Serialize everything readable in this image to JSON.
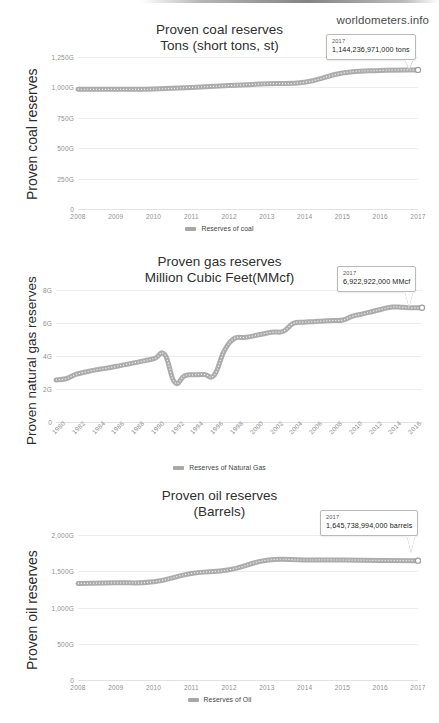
{
  "watermark": "worldometers.info",
  "charts": [
    {
      "id": "coal",
      "title_line1": "Proven coal reserves",
      "title_line2": "Tons (short tons, st)",
      "y_axis_title": "Proven coal reserves",
      "legend_label": "Reserves of coal",
      "tooltip": {
        "year": "2017",
        "value": "1,144,236,971,000 tons"
      }
    },
    {
      "id": "gas",
      "title_line1": "Proven gas reserves",
      "title_line2": "Million Cubic Feet(MMcf)",
      "y_axis_title": "Proven natural gas reserves",
      "legend_label": "Reserves of Natural Gas",
      "tooltip": {
        "year": "2017",
        "value": "6,922,922,000 MMcf"
      }
    },
    {
      "id": "oil",
      "title_line1": "Proven oil reserves",
      "title_line2": "(Barrels)",
      "y_axis_title": "Proven oil reserves",
      "legend_label": "Reserves of Oil",
      "tooltip": {
        "year": "2017",
        "value": "1,645,738,994,000 barrels"
      }
    }
  ],
  "chart_data": [
    {
      "type": "line",
      "id": "coal",
      "title": "Proven coal reserves Tons (short tons, st)",
      "xlabel": "",
      "ylabel": "Proven coal reserves",
      "series_name": "Reserves of coal",
      "grid": true,
      "legend_position": "bottom",
      "ylim": [
        0,
        1250
      ],
      "yticks": [
        0,
        250,
        500,
        750,
        1000,
        1250
      ],
      "ytick_labels": [
        "0",
        "250G",
        "500G",
        "750G",
        "1,000G",
        "1,250G"
      ],
      "y_unit": "G (billion short tons)",
      "x": [
        2008,
        2009,
        2010,
        2011,
        2012,
        2013,
        2014,
        2015,
        2016,
        2017
      ],
      "xtick_labels": [
        "2008",
        "2009",
        "2010",
        "2011",
        "2012",
        "2013",
        "2014",
        "2015",
        "2016",
        "2017"
      ],
      "values": [
        985,
        984,
        986,
        1000,
        1015,
        1030,
        1042,
        1118,
        1140,
        1144
      ],
      "annotation": {
        "x": 2017,
        "label": "2017",
        "value_label": "1,144,236,971,000 tons"
      }
    },
    {
      "type": "line",
      "id": "gas",
      "title": "Proven gas reserves Million Cubic Feet(MMcf)",
      "xlabel": "",
      "ylabel": "Proven natural gas reserves",
      "series_name": "Reserves of Natural Gas",
      "grid": true,
      "legend_position": "bottom",
      "ylim": [
        0,
        8
      ],
      "yticks": [
        0,
        2,
        4,
        6,
        8
      ],
      "ytick_labels": [
        "0",
        "2G",
        "4G",
        "6G",
        "8G"
      ],
      "y_unit": "G (billion MMcf)",
      "x": [
        1980,
        1981,
        1982,
        1983,
        1984,
        1985,
        1986,
        1987,
        1988,
        1989,
        1990,
        1991,
        1992,
        1993,
        1994,
        1995,
        1996,
        1997,
        1998,
        1999,
        2000,
        2001,
        2002,
        2003,
        2004,
        2005,
        2006,
        2007,
        2008,
        2009,
        2010,
        2011,
        2012,
        2013,
        2014,
        2015,
        2016,
        2017
      ],
      "xtick_labels": [
        "1980",
        "1982",
        "1984",
        "1986",
        "1988",
        "1990",
        "1992",
        "1994",
        "1996",
        "1998",
        "2000",
        "2002",
        "2004",
        "2006",
        "2008",
        "2010",
        "2012",
        "2014",
        "2016"
      ],
      "values": [
        2.55,
        2.62,
        2.88,
        3.03,
        3.16,
        3.25,
        3.36,
        3.48,
        3.6,
        3.72,
        3.86,
        4.08,
        2.4,
        2.8,
        2.86,
        2.88,
        2.84,
        4.3,
        5.05,
        5.12,
        5.22,
        5.35,
        5.45,
        5.5,
        5.98,
        6.05,
        6.08,
        6.12,
        6.15,
        6.18,
        6.42,
        6.55,
        6.7,
        6.85,
        6.97,
        6.95,
        6.92,
        6.92
      ],
      "annotation": {
        "x": 2017,
        "label": "2017",
        "value_label": "6,922,922,000 MMcf"
      }
    },
    {
      "type": "line",
      "id": "oil",
      "title": "Proven oil reserves (Barrels)",
      "xlabel": "",
      "ylabel": "Proven oil reserves",
      "series_name": "Reserves of Oil",
      "grid": true,
      "legend_position": "bottom",
      "ylim": [
        0,
        2000
      ],
      "yticks": [
        0,
        500,
        1000,
        1500,
        2000
      ],
      "ytick_labels": [
        "0",
        "500G",
        "1,000G",
        "1,500G",
        "2,000G"
      ],
      "y_unit": "G (billion barrels)",
      "x": [
        2008,
        2009,
        2010,
        2011,
        2012,
        2013,
        2014,
        2015,
        2016,
        2017
      ],
      "xtick_labels": [
        "2008",
        "2009",
        "2010",
        "2011",
        "2012",
        "2013",
        "2014",
        "2015",
        "2016",
        "2017"
      ],
      "values": [
        1332,
        1340,
        1355,
        1470,
        1520,
        1652,
        1655,
        1655,
        1650,
        1646
      ],
      "annotation": {
        "x": 2017,
        "label": "2017",
        "value_label": "1,645,738,994,000 barrels"
      }
    }
  ],
  "colors": {
    "series": "#a8a8a8",
    "grid": "#ededed",
    "tick_text": "#8f8f8f",
    "title_text": "#2f2f2f"
  },
  "bottom_caption": ""
}
